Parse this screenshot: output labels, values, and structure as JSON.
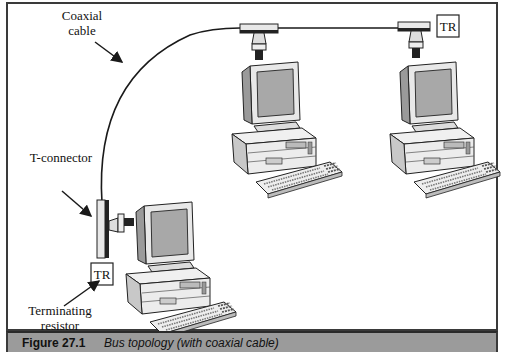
{
  "figure": {
    "number": "Figure 27.1",
    "caption": "Bus topology (with coaxial cable)"
  },
  "labels": {
    "coaxial_cable_line1": "Coaxial",
    "coaxial_cable_line2": "cable",
    "t_connector": "T-connector",
    "terminating_resistor_line1": "Terminating",
    "terminating_resistor_line2": "resistor"
  },
  "terminators": {
    "left": "TR",
    "right": "TR"
  },
  "nodes": [
    {
      "name": "workstation-left"
    },
    {
      "name": "workstation-center"
    },
    {
      "name": "workstation-right"
    }
  ],
  "colors": {
    "border": "#3a3a3a",
    "caption_bg": "#9b9b9b",
    "line": "#1a1a1a",
    "device_fill": "#e6e6e6",
    "screen_fill": "#a8a8a8"
  }
}
